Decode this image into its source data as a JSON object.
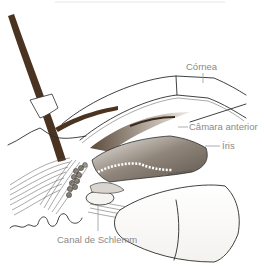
{
  "figure": {
    "title_faint": "",
    "labels": {
      "cornea": "Córnea",
      "anterior_chamber": "Câmara anterior",
      "iris": "Íris",
      "schlemm_canal": "Canal de Schlemm"
    },
    "colors": {
      "background": "#ffffff",
      "vessel_brown": "#4a3320",
      "tissue_grey": "#8c8277",
      "tissue_light": "#d9d4cd",
      "label_grey": "#8a8a8a",
      "line_ink": "#2b2b2b"
    }
  }
}
